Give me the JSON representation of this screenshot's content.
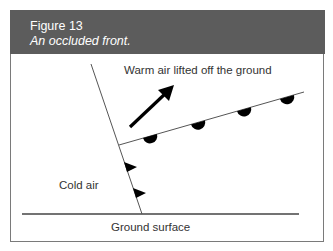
{
  "figure": {
    "number": "Figure 13",
    "caption": "An occluded front."
  },
  "labels": {
    "warm_air": "Warm air lifted off the ground",
    "cold_air": "Cold air",
    "ground": "Ground surface"
  },
  "colors": {
    "header_bg": "#5c5c5c",
    "line": "#444444",
    "symbol": "#000000",
    "frame": "#7a7a7a"
  }
}
